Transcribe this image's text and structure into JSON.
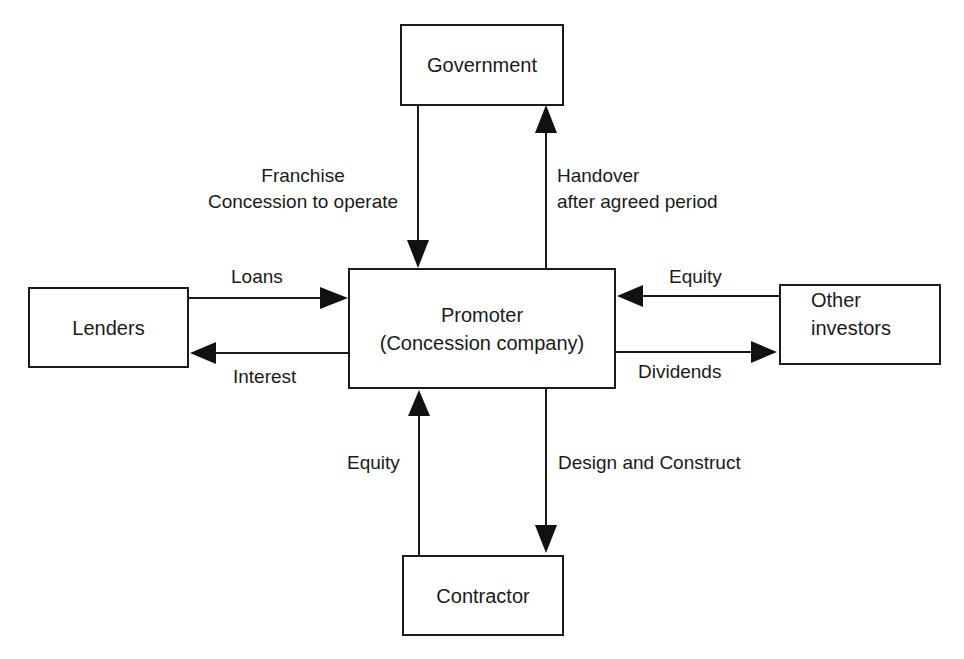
{
  "diagram": {
    "nodes": {
      "government": "Government",
      "promoter": "Promoter\n(Concession company)",
      "promoter_line1": "Promoter",
      "promoter_line2": "(Concession company)",
      "lenders": "Lenders",
      "other_investors_line1": "Other",
      "other_investors_line2": "investors",
      "contractor": "Contractor"
    },
    "edges": [
      {
        "from": "Government",
        "to": "Promoter",
        "label": "Franchise / Concession to operate"
      },
      {
        "from": "Promoter",
        "to": "Government",
        "label": "Handover after agreed period"
      },
      {
        "from": "Lenders",
        "to": "Promoter",
        "label": "Loans"
      },
      {
        "from": "Promoter",
        "to": "Lenders",
        "label": "Interest"
      },
      {
        "from": "Other investors",
        "to": "Promoter",
        "label": "Equity"
      },
      {
        "from": "Promoter",
        "to": "Other investors",
        "label": "Dividends"
      },
      {
        "from": "Contractor",
        "to": "Promoter",
        "label": "Equity"
      },
      {
        "from": "Promoter",
        "to": "Contractor",
        "label": "Design and Construct"
      }
    ],
    "labels": {
      "franchise_line1": "Franchise",
      "franchise_line2": "Concession to operate",
      "handover_line1": "Handover",
      "handover_line2": "after agreed period",
      "loans": "Loans",
      "interest": "Interest",
      "equity_investors": "Equity",
      "dividends": "Dividends",
      "equity_contractor": "Equity",
      "design_construct": "Design and Construct"
    }
  }
}
